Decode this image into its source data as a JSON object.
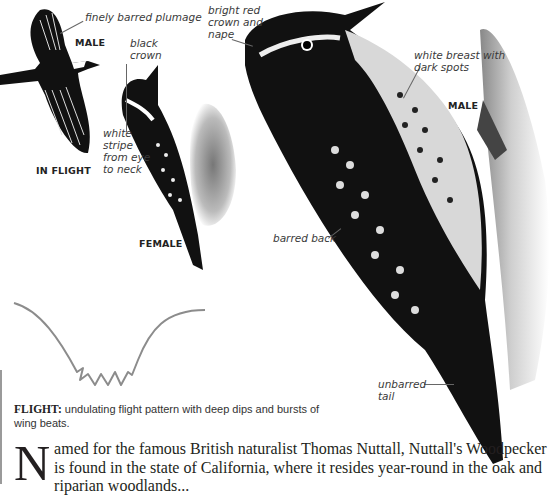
{
  "illustrations": {
    "flying_male": {
      "annotation": "finely barred plumage",
      "sex_label": "MALE",
      "caption": "IN FLIGHT"
    },
    "female": {
      "annotations": [
        "black\ncrown",
        "white\nstripe\nfrom eye\nto neck"
      ],
      "caption": "FEMALE"
    },
    "male": {
      "annotations": {
        "crown": "bright red\ncrown and\nnape",
        "breast": "white breast with\ndark spots",
        "back": "barred back",
        "tail": "unbarred\ntail"
      },
      "caption": "MALE"
    }
  },
  "flight": {
    "heading": "FLIGHT:",
    "description": "undulating flight pattern with deep dips and bursts of wing beats.",
    "line_color": "#8c8c8c"
  },
  "body": {
    "dropcap": "N",
    "text": "amed for the famous British naturalist Thomas Nuttall, Nuttall's Woodpecker is found in the state of California, where it resides year-round in the oak and riparian woodlands..."
  }
}
